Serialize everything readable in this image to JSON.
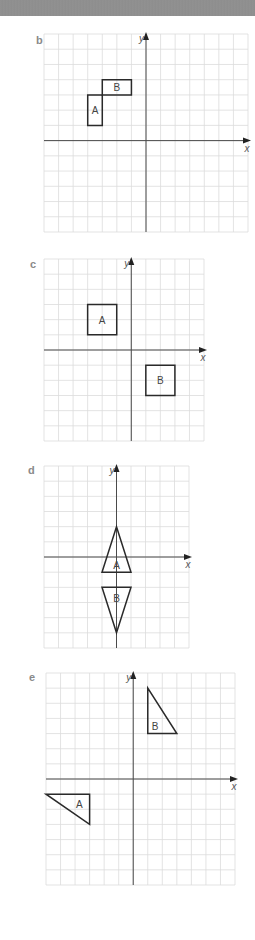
{
  "chart_data": [
    {
      "type": "diagram",
      "part": "b",
      "title": "b",
      "xlabel": "x",
      "ylabel": "y",
      "grid": true,
      "xlim": [
        -7,
        7
      ],
      "ylim": [
        -6,
        7
      ],
      "shapes": [
        {
          "label": "A",
          "kind": "rectangle",
          "vertices": [
            [
              -4,
              1
            ],
            [
              -3,
              1
            ],
            [
              -3,
              3
            ],
            [
              -4,
              3
            ]
          ]
        },
        {
          "label": "B",
          "kind": "rectangle",
          "vertices": [
            [
              -3,
              3
            ],
            [
              -1,
              3
            ],
            [
              -1,
              4
            ],
            [
              -3,
              4
            ]
          ]
        }
      ]
    },
    {
      "type": "diagram",
      "part": "c",
      "title": "c",
      "xlabel": "x",
      "ylabel": "y",
      "grid": true,
      "xlim": [
        -6,
        5
      ],
      "ylim": [
        -6,
        6
      ],
      "shapes": [
        {
          "label": "A",
          "kind": "square",
          "vertices": [
            [
              -3,
              1
            ],
            [
              -1,
              1
            ],
            [
              -1,
              3
            ],
            [
              -3,
              3
            ]
          ]
        },
        {
          "label": "B",
          "kind": "square",
          "vertices": [
            [
              1,
              -3
            ],
            [
              3,
              -3
            ],
            [
              3,
              -1
            ],
            [
              1,
              -1
            ]
          ]
        }
      ]
    },
    {
      "type": "diagram",
      "part": "d",
      "title": "d",
      "xlabel": "x",
      "ylabel": "y",
      "grid": true,
      "xlim": [
        -5,
        5
      ],
      "ylim": [
        -6,
        6
      ],
      "shapes": [
        {
          "label": "A",
          "kind": "triangle",
          "vertices": [
            [
              0,
              2
            ],
            [
              -1,
              -1
            ],
            [
              1,
              -1
            ]
          ]
        },
        {
          "label": "B",
          "kind": "triangle",
          "vertices": [
            [
              -1,
              -2
            ],
            [
              1,
              -2
            ],
            [
              0,
              -5
            ]
          ]
        }
      ]
    },
    {
      "type": "diagram",
      "part": "e",
      "title": "e",
      "xlabel": "x",
      "ylabel": "y",
      "grid": true,
      "xlim": [
        -6,
        7
      ],
      "ylim": [
        -7,
        7
      ],
      "shapes": [
        {
          "label": "A",
          "kind": "right-triangle",
          "vertices": [
            [
              -6,
              -1
            ],
            [
              -3,
              -1
            ],
            [
              -3,
              -3
            ]
          ]
        },
        {
          "label": "B",
          "kind": "right-triangle",
          "vertices": [
            [
              1,
              6
            ],
            [
              1,
              3
            ],
            [
              3,
              3
            ]
          ]
        }
      ]
    }
  ],
  "layout": [
    {
      "left": 44,
      "top": 34,
      "width": 204,
      "height": 198,
      "labelX": 36,
      "labelY": 36
    },
    {
      "left": 44,
      "top": 259,
      "width": 160,
      "height": 182,
      "labelX": 30,
      "labelY": 260
    },
    {
      "left": 44,
      "top": 466,
      "width": 145,
      "height": 182,
      "labelX": 28,
      "labelY": 466
    },
    {
      "left": 46,
      "top": 673,
      "width": 189,
      "height": 212,
      "labelX": 29,
      "labelY": 673
    }
  ],
  "colors": {
    "grid": "#dcdcdc",
    "axis": "#4a4a4a",
    "shape": "#2a2a2a",
    "shape_label": "#444444",
    "axis_label": "#555555",
    "part_label": "#8a8a8a",
    "header": "#8f8f8f"
  }
}
